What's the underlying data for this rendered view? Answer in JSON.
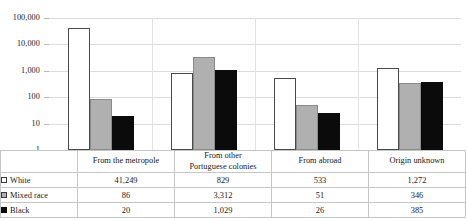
{
  "chart_data": {
    "type": "bar",
    "title": "",
    "subtitle": "",
    "xlabel": "",
    "ylabel": "",
    "yscale": "log",
    "ylim": [
      1,
      100000
    ],
    "grid": true,
    "legend_position": "table-row-headers",
    "y_ticks": [
      "1",
      "10",
      "100",
      "1,000",
      "10,000",
      "100,000"
    ],
    "y_tick_values": [
      1,
      10,
      100,
      1000,
      10000,
      100000
    ],
    "categories": [
      "From the metropole",
      "From other Portuguese colonies",
      "From abroad",
      "Origin unknown"
    ],
    "category_lines": [
      [
        "From the metropole"
      ],
      [
        "From other",
        "Portuguese colonies"
      ],
      [
        "From abroad"
      ],
      [
        "Origin unknown"
      ]
    ],
    "series": [
      {
        "name": "White",
        "marker": "white-square",
        "color": "#ffffff",
        "values": [
          41249,
          829,
          533,
          1272
        ],
        "labels": [
          "41,249",
          "829",
          "533",
          "1,272"
        ]
      },
      {
        "name": "Mixed race",
        "marker": "gray-square",
        "color": "#b0b0b0",
        "values": [
          86,
          3312,
          51,
          346
        ],
        "labels": [
          "86",
          "3,312",
          "51",
          "346"
        ]
      },
      {
        "name": "Black",
        "marker": "black-square",
        "color": "#0b0b0b",
        "values": [
          20,
          1029,
          26,
          385
        ],
        "labels": [
          "20",
          "1,029",
          "26",
          "385"
        ]
      }
    ]
  },
  "table": {
    "corner_label": "",
    "row_header_labels": [
      "White",
      "Mixed race",
      "Black"
    ]
  }
}
